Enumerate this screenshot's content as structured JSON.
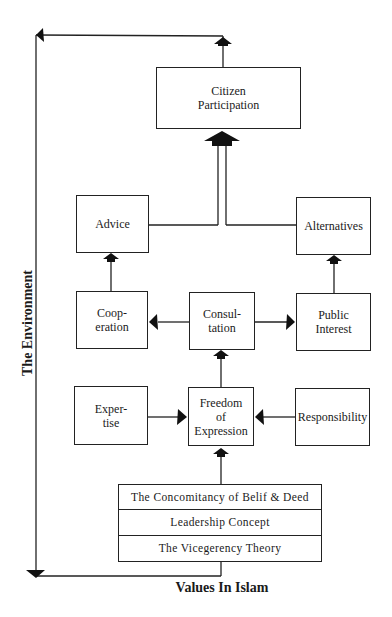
{
  "diagram": {
    "nodes": {
      "citizen_participation": "Citizen\nParticipation",
      "advice": "Advice",
      "alternatives": "Alternatives",
      "cooperation": "Coop-\neration",
      "consultation": "Consul-\ntation",
      "public_interest": "Public\nInterest",
      "expertise": "Exper-\ntise",
      "freedom_of_expression": "Freedom\nof\nExpression",
      "responsibility": "Responsibility"
    },
    "values_stack": [
      "The Concomitancy of Belif & Deed",
      "Leadership Concept",
      "The Vicegerency Theory"
    ],
    "labels": {
      "environment": "The Environment",
      "values_in_islam": "Values In Islam"
    },
    "edges": [
      {
        "from": "Values In Islam",
        "to": "Freedom of Expression"
      },
      {
        "from": "Expertise",
        "to": "Freedom of Expression"
      },
      {
        "from": "Responsibility",
        "to": "Freedom of Expression"
      },
      {
        "from": "Freedom of Expression",
        "to": "Consultation"
      },
      {
        "from": "Consultation",
        "to": "Cooperation"
      },
      {
        "from": "Consultation",
        "to": "Public Interest"
      },
      {
        "from": "Cooperation",
        "to": "Advice"
      },
      {
        "from": "Public Interest",
        "to": "Alternatives"
      },
      {
        "from": "Advice",
        "to": "Citizen Participation"
      },
      {
        "from": "Alternatives",
        "to": "Citizen Participation"
      },
      {
        "from": "Citizen Participation",
        "to": "The Environment"
      },
      {
        "from": "The Environment",
        "to": "Values In Islam"
      }
    ]
  }
}
